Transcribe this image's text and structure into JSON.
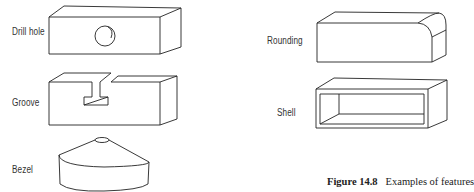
{
  "figure": {
    "caption_number": "Figure 14.8",
    "caption_text": "Examples of features"
  },
  "features": [
    {
      "label": "Drill hole",
      "shape": "block-with-hole"
    },
    {
      "label": "Groove",
      "shape": "block-with-t-slot"
    },
    {
      "label": "Bezel",
      "shape": "truncated-cone-disk"
    },
    {
      "label": "Rounding",
      "shape": "block-with-rounded-edge"
    },
    {
      "label": "Shell",
      "shape": "hollow-box"
    }
  ]
}
